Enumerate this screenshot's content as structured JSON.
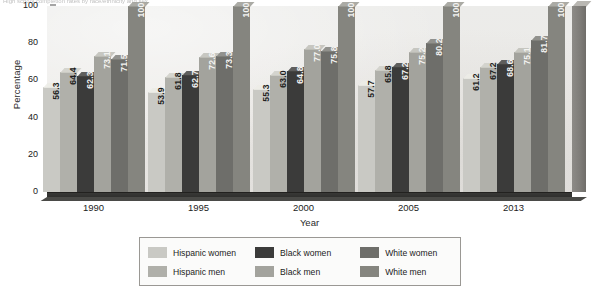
{
  "caption": {
    "text": "High school completion rates by race/ethnicity and sex"
  },
  "chart_data": {
    "type": "bar",
    "title": "",
    "xlabel": "Year",
    "ylabel": "Percentage",
    "categories": [
      "1990",
      "1995",
      "2000",
      "2005",
      "2013"
    ],
    "ylim": [
      0,
      100
    ],
    "yticks": [
      "0",
      "20",
      "40",
      "60",
      "80",
      "100"
    ],
    "grid": false,
    "legend_position": "bottom",
    "series": [
      {
        "name": "Hispanic women",
        "color": "#c9c9c4",
        "label_color": "dark",
        "values": [
          56.3,
          53.9,
          55.3,
          57.7,
          61.2
        ],
        "labels": [
          "56.3",
          "53.9",
          "55.3",
          "57.7",
          "61.2"
        ]
      },
      {
        "name": "Hispanic men",
        "color": "#b0b0aa",
        "label_color": "dark",
        "values": [
          64.4,
          61.8,
          63.0,
          65.8,
          67.2
        ],
        "labels": [
          "64.4",
          "61.8",
          "63.0",
          "65.8",
          "67.2"
        ]
      },
      {
        "name": "Black women",
        "color": "#3b3b3a",
        "label_color": "light",
        "values": [
          62.3,
          62.7,
          64.8,
          67.2,
          68.6
        ],
        "labels": [
          "62.3",
          "62.7",
          "64.8",
          "67.2",
          "68.6"
        ]
      },
      {
        "name": "Black men",
        "color": "#a3a39d",
        "label_color": "light",
        "values": [
          73.1,
          72.6,
          77.0,
          75.2,
          75.1
        ],
        "labels": [
          "73.1",
          "72.6",
          "77.0",
          "75.2",
          "75.1"
        ]
      },
      {
        "name": "White women",
        "color": "#6e6e6a",
        "label_color": "light",
        "values": [
          71.5,
          73.3,
          75.8,
          80.2,
          81.7
        ],
        "labels": [
          "71.5",
          "73.3",
          "75.8",
          "80.2",
          "81.7"
        ]
      },
      {
        "name": "White men",
        "color": "#85857f",
        "label_color": "light",
        "values": [
          100,
          100,
          100,
          100,
          100
        ],
        "labels": [
          "100",
          "100",
          "100",
          "100",
          "100"
        ]
      }
    ]
  }
}
